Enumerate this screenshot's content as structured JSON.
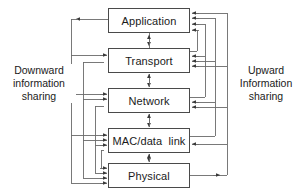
{
  "diagram": {
    "type": "block-diagram",
    "width": 299,
    "height": 196,
    "background_color": "#ffffff",
    "line_color": "#4a4a4a",
    "text_color": "#1a1a1a",
    "layers": [
      {
        "id": "application",
        "label": "Application",
        "x": 108,
        "y": 8,
        "width": 82,
        "height": 25,
        "left_arrowheads": 0,
        "left_outgoing_arrows": 1,
        "right_arrowheads": 4
      },
      {
        "id": "transport",
        "label": "Transport",
        "x": 108,
        "y": 48,
        "width": 82,
        "height": 25,
        "left_arrowheads": 2,
        "left_outgoing_arrows": 0,
        "right_arrowheads": 3
      },
      {
        "id": "network",
        "label": "Network",
        "x": 108,
        "y": 88,
        "width": 82,
        "height": 25,
        "left_arrowheads": 3,
        "left_outgoing_arrows": 0,
        "right_arrowheads": 3
      },
      {
        "id": "mac-data-link",
        "label": "MAC/data  link",
        "x": 108,
        "y": 128,
        "width": 82,
        "height": 25,
        "left_arrowheads": 3,
        "left_outgoing_arrows": 0,
        "right_arrowheads": 2
      },
      {
        "id": "physical",
        "label": "Physical",
        "x": 108,
        "y": 163,
        "width": 82,
        "height": 25,
        "left_arrowheads": 4,
        "left_outgoing_arrows": 0,
        "right_arrowheads": 0
      }
    ],
    "side_labels": {
      "left": "Downward\ninformation\nsharing",
      "right": "Upward\nInformation\nsharing"
    },
    "vertical_links": [
      {
        "from": "application",
        "to": "transport",
        "direction": "bidirectional"
      },
      {
        "from": "transport",
        "to": "network",
        "direction": "bidirectional"
      },
      {
        "from": "network",
        "to": "mac-data-link",
        "direction": "bidirectional"
      },
      {
        "from": "mac-data-link",
        "to": "physical",
        "direction": "bidirectional"
      }
    ]
  }
}
